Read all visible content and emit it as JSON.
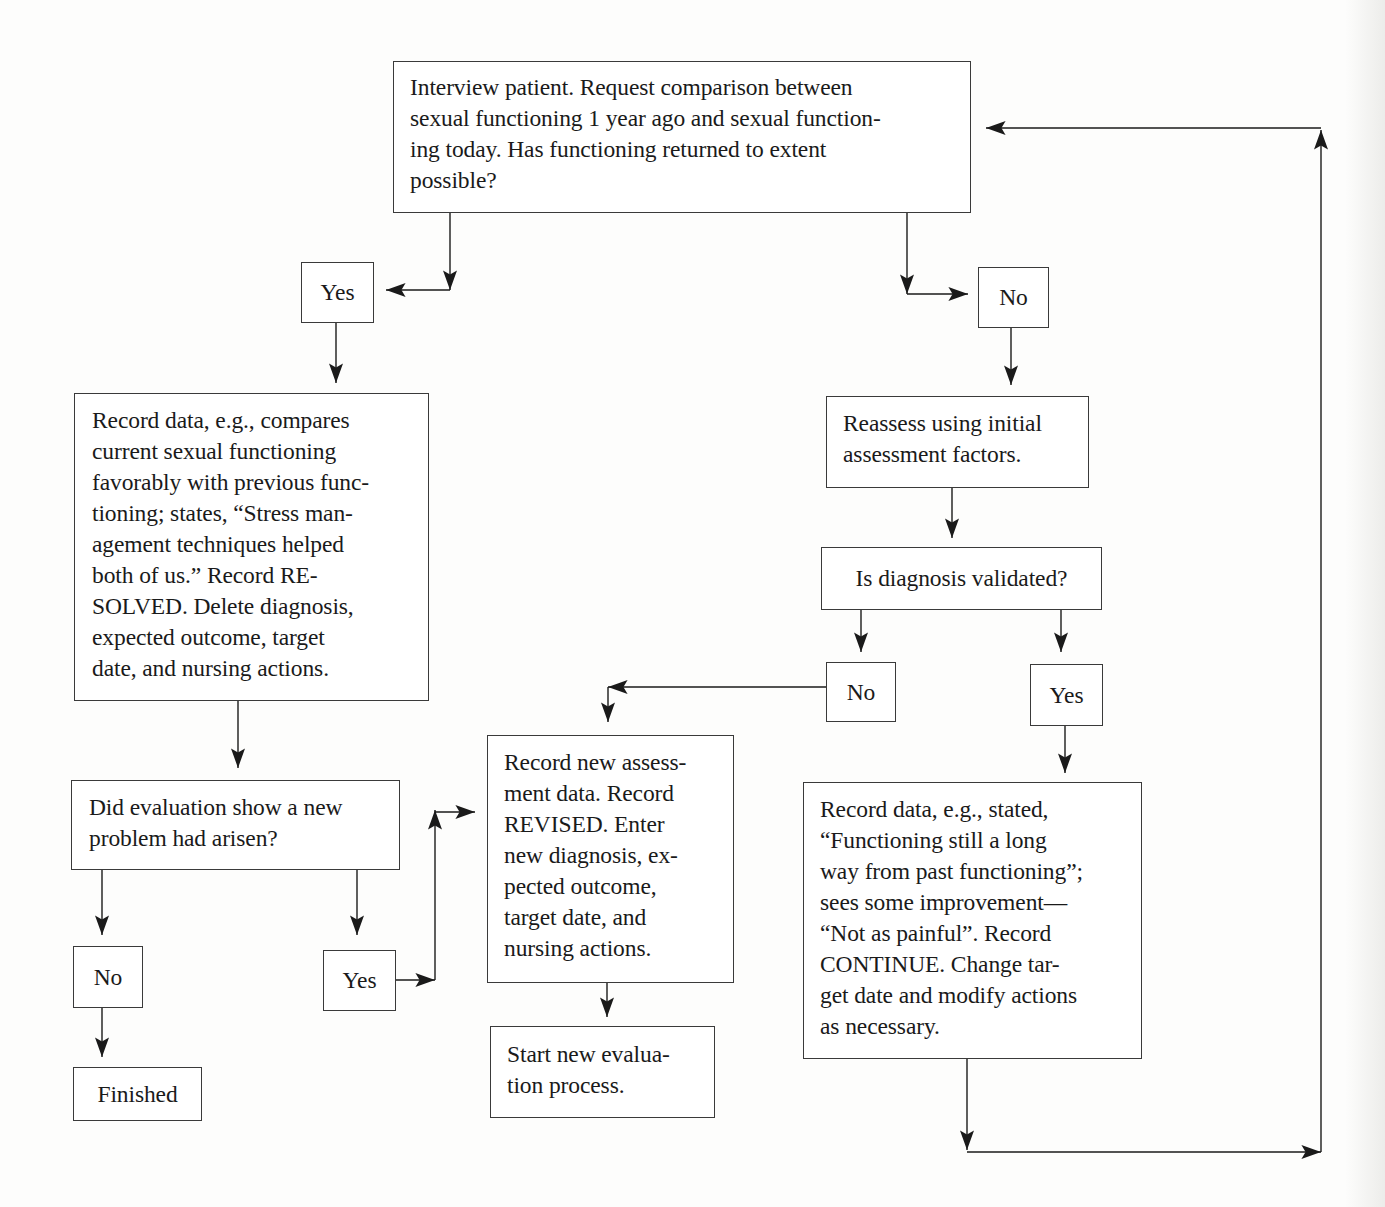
{
  "diagram": {
    "type": "flowchart",
    "nodes": {
      "interview": "Interview patient. Request comparison between\nsexual functioning 1 year ago and sexual function-\ning today. Has functioning returned to extent\npossible?",
      "yes_top": "Yes",
      "no_top": "No",
      "record_resolved": "Record data, e.g., compares\ncurrent sexual functioning\nfavorably with previous func-\ntioning; states, “Stress man-\nagement techniques helped\nboth of us.” Record RE-\nSOLVED. Delete diagnosis,\nexpected outcome, target\ndate, and nursing actions.",
      "reassess": "Reassess using initial\nassessment factors.",
      "diagnosis_validated": "Is diagnosis validated?",
      "no_validated": "No",
      "yes_validated": "Yes",
      "new_problem": "Did evaluation show a new\nproblem had arisen?",
      "no_new_problem": "No",
      "yes_new_problem": "Yes",
      "finished": "Finished",
      "record_revised": "Record new assess-\nment data. Record\nREVISED. Enter\nnew diagnosis, ex-\npected outcome,\ntarget date, and\nnursing actions.",
      "start_new": "Start new evalua-\ntion process.",
      "record_continue": "Record data, e.g., stated,\n“Functioning still a long\nway from past functioning”;\nsees some improvement—\n“Not as painful”. Record\nCONTINUE. Change tar-\nget date and modify actions\nas necessary."
    },
    "edges": [
      {
        "from": "interview",
        "to": "yes_top"
      },
      {
        "from": "interview",
        "to": "no_top"
      },
      {
        "from": "yes_top",
        "to": "record_resolved"
      },
      {
        "from": "record_resolved",
        "to": "new_problem"
      },
      {
        "from": "new_problem",
        "to": "no_new_problem"
      },
      {
        "from": "new_problem",
        "to": "yes_new_problem"
      },
      {
        "from": "no_new_problem",
        "to": "finished"
      },
      {
        "from": "yes_new_problem",
        "to": "record_revised"
      },
      {
        "from": "no_top",
        "to": "reassess"
      },
      {
        "from": "reassess",
        "to": "diagnosis_validated"
      },
      {
        "from": "diagnosis_validated",
        "to": "no_validated"
      },
      {
        "from": "diagnosis_validated",
        "to": "yes_validated"
      },
      {
        "from": "no_validated",
        "to": "record_revised"
      },
      {
        "from": "record_revised",
        "to": "start_new"
      },
      {
        "from": "yes_validated",
        "to": "record_continue"
      },
      {
        "from": "record_continue",
        "to": "interview",
        "label": "loop back"
      }
    ],
    "colors": {
      "line": "#1a1a1a",
      "border": "#3a3a3a",
      "background": "#fdfdfc"
    }
  }
}
